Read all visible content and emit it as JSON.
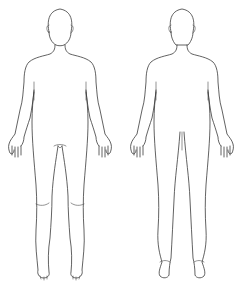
{
  "diagram": {
    "title": "",
    "figures": [
      {
        "id": "front",
        "label": "",
        "view": "anterior"
      },
      {
        "id": "back",
        "label": "",
        "view": "posterior"
      }
    ],
    "stroke_color": "#3a3a3a",
    "background": "#ffffff"
  }
}
